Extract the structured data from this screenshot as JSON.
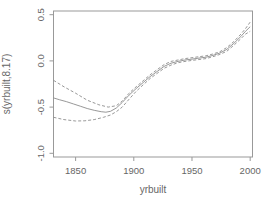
{
  "figure": {
    "background": "#ffffff"
  },
  "chart_data": {
    "type": "line",
    "title": "",
    "xlabel": "yrbuilt",
    "ylabel": "s(yrbuilt,8.17)",
    "xlim": [
      1831,
      2002
    ],
    "ylim": [
      -1.04,
      0.54
    ],
    "x_ticks": [
      1850,
      1900,
      1950,
      2000
    ],
    "x_tick_labels": [
      "1850",
      "1900",
      "1950",
      "2000"
    ],
    "y_ticks": [
      0.5,
      0.0,
      -0.5,
      -1.0
    ],
    "y_tick_labels": [
      "0.5",
      "0.0",
      "-0.5",
      "-1.0"
    ],
    "grid": false,
    "legend": "none",
    "colors": {
      "line": "#8c8c8c",
      "frame": "#999999",
      "text": "#666666"
    },
    "series": [
      {
        "name": "smooth-fit",
        "style": "solid",
        "points": [
          [
            1831,
            -0.4
          ],
          [
            1836,
            -0.42
          ],
          [
            1842,
            -0.44
          ],
          [
            1848,
            -0.465
          ],
          [
            1854,
            -0.49
          ],
          [
            1860,
            -0.515
          ],
          [
            1866,
            -0.535
          ],
          [
            1872,
            -0.55
          ],
          [
            1876,
            -0.555
          ],
          [
            1880,
            -0.545
          ],
          [
            1885,
            -0.51
          ],
          [
            1890,
            -0.45
          ],
          [
            1896,
            -0.37
          ],
          [
            1902,
            -0.3
          ],
          [
            1908,
            -0.235
          ],
          [
            1914,
            -0.17
          ],
          [
            1920,
            -0.115
          ],
          [
            1926,
            -0.06
          ],
          [
            1932,
            -0.025
          ],
          [
            1938,
            -0.005
          ],
          [
            1944,
            0.01
          ],
          [
            1950,
            0.02
          ],
          [
            1956,
            0.03
          ],
          [
            1962,
            0.04
          ],
          [
            1968,
            0.06
          ],
          [
            1974,
            0.085
          ],
          [
            1980,
            0.125
          ],
          [
            1986,
            0.19
          ],
          [
            1992,
            0.265
          ],
          [
            1996,
            0.32
          ],
          [
            2000,
            0.37
          ]
        ]
      },
      {
        "name": "ci-upper",
        "style": "dashed",
        "points": [
          [
            1831,
            -0.21
          ],
          [
            1840,
            -0.28
          ],
          [
            1850,
            -0.35
          ],
          [
            1860,
            -0.425
          ],
          [
            1870,
            -0.475
          ],
          [
            1878,
            -0.5
          ],
          [
            1885,
            -0.485
          ],
          [
            1890,
            -0.435
          ],
          [
            1896,
            -0.35
          ],
          [
            1902,
            -0.28
          ],
          [
            1908,
            -0.215
          ],
          [
            1914,
            -0.15
          ],
          [
            1920,
            -0.095
          ],
          [
            1926,
            -0.04
          ],
          [
            1932,
            -0.005
          ],
          [
            1938,
            0.01
          ],
          [
            1944,
            0.025
          ],
          [
            1950,
            0.035
          ],
          [
            1956,
            0.045
          ],
          [
            1962,
            0.055
          ],
          [
            1968,
            0.075
          ],
          [
            1974,
            0.1
          ],
          [
            1980,
            0.145
          ],
          [
            1986,
            0.21
          ],
          [
            1992,
            0.29
          ],
          [
            1996,
            0.35
          ],
          [
            2000,
            0.42
          ]
        ]
      },
      {
        "name": "ci-lower",
        "style": "dashed",
        "points": [
          [
            1831,
            -0.61
          ],
          [
            1840,
            -0.635
          ],
          [
            1850,
            -0.65
          ],
          [
            1858,
            -0.648
          ],
          [
            1866,
            -0.635
          ],
          [
            1874,
            -0.61
          ],
          [
            1880,
            -0.585
          ],
          [
            1885,
            -0.55
          ],
          [
            1890,
            -0.5
          ],
          [
            1896,
            -0.415
          ],
          [
            1902,
            -0.33
          ],
          [
            1908,
            -0.26
          ],
          [
            1914,
            -0.19
          ],
          [
            1920,
            -0.135
          ],
          [
            1926,
            -0.08
          ],
          [
            1932,
            -0.045
          ],
          [
            1938,
            -0.02
          ],
          [
            1944,
            -0.005
          ],
          [
            1950,
            0.005
          ],
          [
            1956,
            0.015
          ],
          [
            1962,
            0.025
          ],
          [
            1968,
            0.045
          ],
          [
            1974,
            0.07
          ],
          [
            1980,
            0.105
          ],
          [
            1986,
            0.17
          ],
          [
            1992,
            0.24
          ],
          [
            1996,
            0.29
          ],
          [
            2000,
            0.32
          ]
        ]
      }
    ]
  }
}
